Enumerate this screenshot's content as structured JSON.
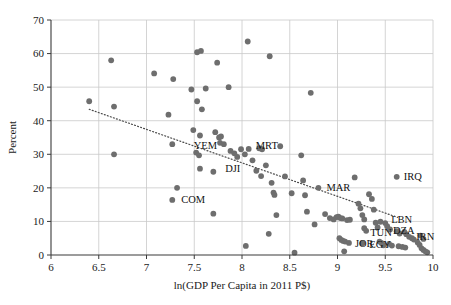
{
  "chart_data": {
    "type": "scatter",
    "title": "",
    "xlabel": "ln(GDP Per Capita in 2011 P$)",
    "ylabel": "Percent",
    "xlim": [
      6,
      10
    ],
    "ylim": [
      0,
      70
    ],
    "xticks": [
      6,
      6.5,
      7,
      7.5,
      8,
      8.5,
      9,
      9.5,
      10
    ],
    "xtick_labels": [
      "6",
      "6.5",
      "7",
      "7.5",
      "8",
      "8.5",
      "9",
      "9.5",
      "10"
    ],
    "yticks": [
      0,
      10,
      20,
      30,
      40,
      50,
      60,
      70
    ],
    "ytick_labels": [
      "0",
      "10",
      "20",
      "30",
      "40",
      "50",
      "60",
      "70"
    ],
    "grid": true,
    "legend": "none",
    "point_color": "#6e6e6e",
    "trendline": {
      "style": "dotted",
      "color": "#4a4a4a",
      "x_start": 6.4,
      "y_start": 43.4,
      "x_end": 9.63,
      "y_end": 11.2
    },
    "points": [
      {
        "x": 6.4,
        "y": 45.8
      },
      {
        "x": 6.63,
        "y": 58.0
      },
      {
        "x": 6.66,
        "y": 44.2
      },
      {
        "x": 6.66,
        "y": 30.0
      },
      {
        "x": 7.08,
        "y": 54.1
      },
      {
        "x": 7.23,
        "y": 41.8
      },
      {
        "x": 7.27,
        "y": 33.0
      },
      {
        "x": 7.28,
        "y": 52.4
      },
      {
        "x": 7.32,
        "y": 20.0
      },
      {
        "x": 7.27,
        "y": 16.4,
        "label": "COM",
        "label_dx": 9,
        "label_dy": 3.5
      },
      {
        "x": 7.47,
        "y": 49.3
      },
      {
        "x": 7.53,
        "y": 60.4
      },
      {
        "x": 7.57,
        "y": 60.8
      },
      {
        "x": 7.53,
        "y": 45.8
      },
      {
        "x": 7.49,
        "y": 37.2
      },
      {
        "x": 7.52,
        "y": 30.5
      },
      {
        "x": 7.58,
        "y": 43.4
      },
      {
        "x": 7.62,
        "y": 49.6
      },
      {
        "x": 7.56,
        "y": 35.6
      },
      {
        "x": 7.55,
        "y": 29.7
      },
      {
        "x": 7.56,
        "y": 25.7
      },
      {
        "x": 7.7,
        "y": 12.3
      },
      {
        "x": 7.7,
        "y": 24.8
      },
      {
        "x": 7.74,
        "y": 57.3
      },
      {
        "x": 7.72,
        "y": 36.6
      },
      {
        "x": 7.76,
        "y": 35.0
      },
      {
        "x": 7.78,
        "y": 35.3
      },
      {
        "x": 7.77,
        "y": 33.4
      },
      {
        "x": 7.81,
        "y": 33.0
      },
      {
        "x": 7.86,
        "y": 50.0
      },
      {
        "x": 7.88,
        "y": 31.0
      },
      {
        "x": 7.92,
        "y": 30.3
      },
      {
        "x": 7.95,
        "y": 29.2
      },
      {
        "x": 7.99,
        "y": 31.5,
        "label": "YEM",
        "label_dx": -24,
        "label_dy": 0
      },
      {
        "x": 8.03,
        "y": 30.0
      },
      {
        "x": 8.07,
        "y": 31.6,
        "label": "MRT",
        "label_dx": 7,
        "label_dy": 0
      },
      {
        "x": 8.06,
        "y": 63.6
      },
      {
        "x": 8.04,
        "y": 2.7
      },
      {
        "x": 8.11,
        "y": 28.2
      },
      {
        "x": 8.15,
        "y": 25.1,
        "label": "DJI",
        "label_dx": -16,
        "label_dy": 1.0
      },
      {
        "x": 8.18,
        "y": 31.8
      },
      {
        "x": 8.21,
        "y": 31.5
      },
      {
        "x": 8.2,
        "y": 23.5
      },
      {
        "x": 8.25,
        "y": 26.7
      },
      {
        "x": 8.29,
        "y": 59.2
      },
      {
        "x": 8.31,
        "y": 21.5
      },
      {
        "x": 8.33,
        "y": 18.6
      },
      {
        "x": 8.34,
        "y": 17.9
      },
      {
        "x": 8.36,
        "y": 11.9
      },
      {
        "x": 8.28,
        "y": 6.3
      },
      {
        "x": 8.4,
        "y": 32.4
      },
      {
        "x": 8.45,
        "y": 23.4
      },
      {
        "x": 8.52,
        "y": 18.4
      },
      {
        "x": 8.55,
        "y": 0.7
      },
      {
        "x": 8.62,
        "y": 29.7
      },
      {
        "x": 8.64,
        "y": 22.2
      },
      {
        "x": 8.66,
        "y": 17.8
      },
      {
        "x": 8.68,
        "y": 12.9
      },
      {
        "x": 8.72,
        "y": 48.3
      },
      {
        "x": 8.76,
        "y": 9.1
      },
      {
        "x": 8.8,
        "y": 20.0,
        "label": "MAR",
        "label_dx": 8,
        "label_dy": 3.5
      },
      {
        "x": 8.87,
        "y": 12.2
      },
      {
        "x": 8.92,
        "y": 11.0
      },
      {
        "x": 8.96,
        "y": 10.6
      },
      {
        "x": 8.99,
        "y": 11.3
      },
      {
        "x": 9.01,
        "y": 11.4
      },
      {
        "x": 9.03,
        "y": 11.0
      },
      {
        "x": 9.05,
        "y": 10.9
      },
      {
        "x": 9.02,
        "y": 5.0
      },
      {
        "x": 9.04,
        "y": 4.5
      },
      {
        "x": 9.06,
        "y": 4.2
      },
      {
        "x": 9.08,
        "y": 4.0
      },
      {
        "x": 9.07,
        "y": 1.1
      },
      {
        "x": 9.1,
        "y": 10.4
      },
      {
        "x": 9.13,
        "y": 10.5
      },
      {
        "x": 9.12,
        "y": 3.6,
        "label": "JOR",
        "label_dx": 6,
        "label_dy": 4.5
      },
      {
        "x": 9.18,
        "y": 23.1
      },
      {
        "x": 9.22,
        "y": 15.3
      },
      {
        "x": 9.24,
        "y": 13.9
      },
      {
        "x": 9.26,
        "y": 11.9
      },
      {
        "x": 9.28,
        "y": 10.6
      },
      {
        "x": 9.28,
        "y": 8.0
      },
      {
        "x": 9.3,
        "y": 7.2,
        "label": "TUN",
        "label_dx": 4,
        "label_dy": 5.5
      },
      {
        "x": 9.26,
        "y": 3.5,
        "label": "EGY",
        "label_dx": 7,
        "label_dy": 4.5
      },
      {
        "x": 9.33,
        "y": 18.1
      },
      {
        "x": 9.36,
        "y": 16.7
      },
      {
        "x": 9.38,
        "y": 13.5
      },
      {
        "x": 9.4,
        "y": 9.6
      },
      {
        "x": 9.42,
        "y": 8.2
      },
      {
        "x": 9.45,
        "y": 9.9
      },
      {
        "x": 9.44,
        "y": 4.0
      },
      {
        "x": 9.46,
        "y": 3.6
      },
      {
        "x": 9.48,
        "y": 2.9
      },
      {
        "x": 9.5,
        "y": 9.5
      },
      {
        "x": 9.52,
        "y": 8.6,
        "label": "LBN",
        "label_dx": 4,
        "label_dy": -3
      },
      {
        "x": 9.55,
        "y": 7.6,
        "label": "DZA",
        "label_dx": 3,
        "label_dy": 4.5
      },
      {
        "x": 9.54,
        "y": 3.3
      },
      {
        "x": 9.57,
        "y": 2.8
      },
      {
        "x": 9.62,
        "y": 23.3,
        "label": "IRQ",
        "label_dx": 7,
        "label_dy": 3.5
      },
      {
        "x": 9.62,
        "y": 7.1
      },
      {
        "x": 9.65,
        "y": 6.4
      },
      {
        "x": 9.64,
        "y": 2.6
      },
      {
        "x": 9.68,
        "y": 2.4
      },
      {
        "x": 9.7,
        "y": 6.9
      },
      {
        "x": 9.72,
        "y": 6.2
      },
      {
        "x": 9.71,
        "y": 2.2
      },
      {
        "x": 9.75,
        "y": 5.4,
        "label": "IRN",
        "label_dx": 7,
        "label_dy": 3.5
      },
      {
        "x": 9.78,
        "y": 5.0
      },
      {
        "x": 9.8,
        "y": 4.6
      },
      {
        "x": 9.84,
        "y": 3.7
      },
      {
        "x": 9.86,
        "y": 3.0
      },
      {
        "x": 9.88,
        "y": 2.0
      },
      {
        "x": 9.9,
        "y": 1.5
      },
      {
        "x": 9.92,
        "y": 1.1
      },
      {
        "x": 9.94,
        "y": 0.8
      },
      {
        "x": 9.87,
        "y": 5.8
      },
      {
        "x": 9.9,
        "y": 4.8
      }
    ]
  }
}
